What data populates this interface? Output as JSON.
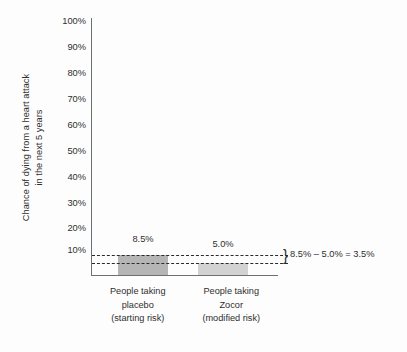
{
  "chart_data": {
    "type": "bar",
    "title": "",
    "xlabel": "",
    "ylabel": "Chance of dying from a heart attack in the next 5 years",
    "ylabel_lines": [
      "Chance of dying from a heart attack",
      "in the next 5 years"
    ],
    "categories": [
      "People taking placebo (starting risk)",
      "People taking Zocor (modified risk)"
    ],
    "category_lines": [
      [
        "People taking",
        "placebo",
        "(starting risk)"
      ],
      [
        "People taking",
        "Zocor",
        "(modified risk)"
      ]
    ],
    "values": [
      8.5,
      5.0
    ],
    "value_labels": [
      "8.5%",
      "5.0%"
    ],
    "bar_colors": [
      "#b5b5b5",
      "#d2d2d2"
    ],
    "ylim": [
      0,
      100
    ],
    "yticks": [
      10,
      20,
      30,
      40,
      50,
      60,
      70,
      80,
      90,
      100
    ],
    "ytick_labels": [
      "100%",
      "90%",
      "80%",
      "70%",
      "60%",
      "50%",
      "40%",
      "30%",
      "20%",
      "10%"
    ],
    "grid": false,
    "legend": "none",
    "reference_lines": [
      {
        "value": 8.5,
        "style": "dashed"
      },
      {
        "value": 5.0,
        "style": "dashed"
      }
    ],
    "annotation": {
      "brace": "}",
      "text": "8.5% – 5.0% = 3.5%"
    }
  },
  "colors": {
    "background": "#fdfdfd",
    "axis": "#6f6f6f",
    "text": "#2f2f2f",
    "dashline": "#2b2b2b"
  }
}
